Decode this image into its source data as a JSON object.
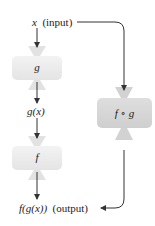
{
  "diagram": {
    "type": "function-composition-machine",
    "input": {
      "var": "x",
      "note": "(input)"
    },
    "machines": [
      {
        "id": "g",
        "label": "g",
        "color": "#ececec"
      },
      {
        "id": "f",
        "label": "f",
        "color": "#ececec"
      },
      {
        "id": "fog",
        "label": "f ∘ g",
        "color": "#d9d9d9"
      }
    ],
    "intermediate": {
      "label": "g(x)"
    },
    "output": {
      "expr": "f(g(x))",
      "note": "(output)"
    },
    "edges": [
      {
        "from": "input",
        "to": "g"
      },
      {
        "from": "g",
        "to": "intermediate"
      },
      {
        "from": "intermediate",
        "to": "f"
      },
      {
        "from": "f",
        "to": "output"
      },
      {
        "from": "input",
        "to": "fog"
      },
      {
        "from": "fog",
        "to": "output"
      }
    ],
    "colors": {
      "line": "#333333",
      "machine_light": "#ececec",
      "machine_dark": "#d9d9d9"
    }
  }
}
